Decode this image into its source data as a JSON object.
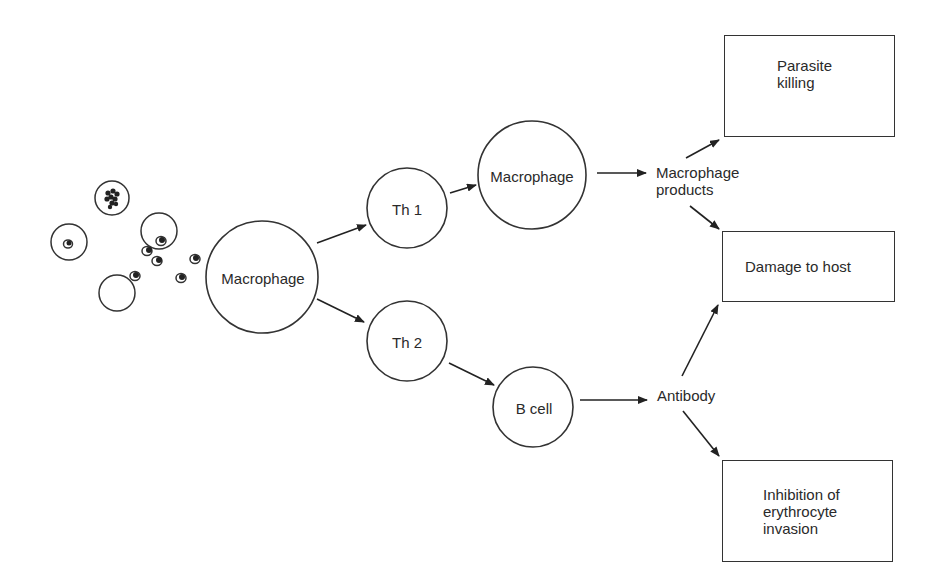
{
  "diagram": {
    "type": "flowchart",
    "parasites": {
      "icon": "infected-erythrocytes-and-merozoites-icon"
    },
    "nodes": {
      "macrophage_1": {
        "label": "Macrophage",
        "shape": "circle"
      },
      "th1": {
        "label": "Th 1",
        "shape": "circle"
      },
      "th2": {
        "label": "Th 2",
        "shape": "circle"
      },
      "macrophage_2": {
        "label": "Macrophage",
        "shape": "circle"
      },
      "b_cell": {
        "label": "B cell",
        "shape": "circle"
      },
      "macrophage_products": {
        "label": "Macrophage\nproducts",
        "shape": "text"
      },
      "antibody": {
        "label": "Antibody",
        "shape": "text"
      },
      "parasite_killing": {
        "label": "Parasite\nkilling",
        "shape": "box"
      },
      "damage_to_host": {
        "label": "Damage to host",
        "shape": "box"
      },
      "inhibition": {
        "label": "Inhibition of\nerythrocyte\ninvasion",
        "shape": "box"
      }
    },
    "edges": [
      {
        "from": "parasites",
        "to": "macrophage_1"
      },
      {
        "from": "macrophage_1",
        "to": "th1"
      },
      {
        "from": "macrophage_1",
        "to": "th2"
      },
      {
        "from": "th1",
        "to": "macrophage_2"
      },
      {
        "from": "macrophage_2",
        "to": "macrophage_products"
      },
      {
        "from": "macrophage_products",
        "to": "parasite_killing"
      },
      {
        "from": "macrophage_products",
        "to": "damage_to_host"
      },
      {
        "from": "th2",
        "to": "b_cell"
      },
      {
        "from": "b_cell",
        "to": "antibody"
      },
      {
        "from": "antibody",
        "to": "damage_to_host"
      },
      {
        "from": "antibody",
        "to": "inhibition"
      }
    ]
  }
}
